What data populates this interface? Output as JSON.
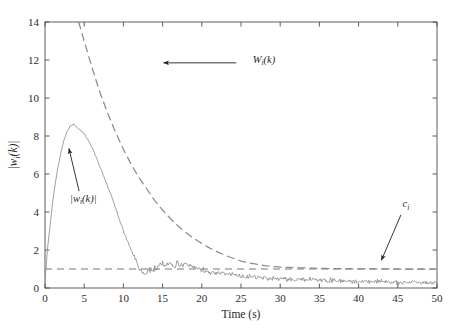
{
  "chart_data": {
    "type": "line",
    "title": "",
    "xlabel": "Time (s)",
    "ylabel": "|w_i(k)|",
    "xlim": [
      0,
      50
    ],
    "ylim": [
      0,
      14
    ],
    "xticks": [
      0,
      5,
      10,
      15,
      20,
      25,
      30,
      35,
      40,
      45,
      50
    ],
    "yticks": [
      0,
      2,
      4,
      6,
      8,
      10,
      12,
      14
    ],
    "grid": false,
    "legend": "none (inline annotations with arrows)",
    "series": [
      {
        "name": "|w_i(k)|",
        "style": "solid",
        "color": "#8c8c8c",
        "description": "noisy signal magnitude: rises steeply from ~0.3 at t=0, peaks ~8.6 near t=3.5, decays to ~0.8 by t=12.5, small noisy bump ~1.3 near t=15-18, then settles to noisy ~0.25-0.5 tail out to t=50",
        "x": [
          0,
          0.3,
          0.6,
          1,
          1.5,
          2,
          2.5,
          3,
          3.3,
          3.6,
          4,
          4.5,
          5,
          5.5,
          6,
          6.5,
          7,
          7.5,
          8,
          8.5,
          9,
          9.5,
          10,
          10.5,
          11,
          11.5,
          12,
          12.5,
          13,
          13.5,
          14,
          14.5,
          15,
          15.5,
          16,
          16.5,
          17,
          17.5,
          18,
          18.5,
          19,
          19.5,
          20,
          21,
          22,
          23,
          24,
          25,
          26,
          27,
          28,
          29,
          30,
          32,
          34,
          36,
          38,
          40,
          42,
          44,
          46,
          48,
          50
        ],
        "y": [
          0.3,
          2.0,
          3.1,
          4.6,
          6.0,
          7.1,
          7.9,
          8.4,
          8.55,
          8.6,
          8.5,
          8.3,
          8.1,
          7.8,
          7.4,
          6.9,
          6.4,
          5.9,
          5.3,
          4.8,
          4.2,
          3.6,
          3.0,
          2.5,
          2.0,
          1.5,
          1.05,
          0.8,
          0.85,
          0.95,
          1.05,
          1.15,
          1.25,
          1.2,
          1.3,
          1.2,
          1.3,
          1.15,
          1.25,
          1.1,
          1.15,
          1.0,
          0.95,
          0.85,
          0.8,
          0.75,
          0.7,
          0.65,
          0.6,
          0.55,
          0.55,
          0.5,
          0.5,
          0.45,
          0.45,
          0.4,
          0.4,
          0.35,
          0.35,
          0.3,
          0.3,
          0.3,
          0.25
        ],
        "noise_amplitude": 0.12
      },
      {
        "name": "W_i(k)",
        "style": "dashed",
        "color": "#8c8c8c",
        "description": "monotonically decreasing envelope/bound, enters top of axes (y=14) at t≈4.3, decays exponentially and asymptotes to c_i = 1 around t≈25",
        "x": [
          4.3,
          5,
          6,
          7,
          8,
          9,
          10,
          11,
          12,
          13,
          14,
          15,
          16,
          17,
          18,
          19,
          20,
          21,
          22,
          23,
          24,
          25,
          26,
          28,
          30,
          35,
          40,
          45,
          50
        ],
        "y": [
          14.0,
          13.0,
          11.6,
          10.3,
          9.2,
          8.2,
          7.3,
          6.5,
          5.8,
          5.2,
          4.6,
          4.1,
          3.65,
          3.25,
          2.9,
          2.6,
          2.35,
          2.1,
          1.9,
          1.72,
          1.56,
          1.42,
          1.32,
          1.18,
          1.1,
          1.03,
          1.01,
          1.0,
          1.0
        ]
      },
      {
        "name": "c_i",
        "style": "dashed-horizontal",
        "color": "#7a7a7a",
        "description": "constant threshold line",
        "value": 1.0,
        "x": [
          0,
          50
        ],
        "y": [
          1.0,
          1.0
        ]
      }
    ],
    "annotations": [
      {
        "id": "annot-W",
        "text_main": "W",
        "text_sub": "i",
        "text_tail": "(k)",
        "label": "W_i(k)",
        "text_x": 26.5,
        "text_y": 11.85,
        "arrow_from_x": 24.4,
        "arrow_from_y": 11.85,
        "arrow_to_x": 15.1,
        "arrow_to_y": 11.85
      },
      {
        "id": "annot-w-abs",
        "text_main": "|w",
        "text_sub": "i",
        "text_tail": "(k)|",
        "label": "|w_i(k)|",
        "text_x": 3.2,
        "text_y": 4.55,
        "arrow_from_x": 4.35,
        "arrow_from_y": 5.1,
        "arrow_to_x": 3.05,
        "arrow_to_y": 7.35
      },
      {
        "id": "annot-c",
        "text_main": "c",
        "text_sub": "i",
        "text_tail": "",
        "label": "c_i",
        "text_x": 45.6,
        "text_y": 4.25,
        "arrow_from_x": 45.4,
        "arrow_from_y": 3.85,
        "arrow_to_x": 42.9,
        "arrow_to_y": 1.45
      }
    ]
  },
  "colors": {
    "axis": "#4d4d4d",
    "signal": "#8c8c8c",
    "envelope": "#8c8c8c",
    "threshold": "#7a7a7a",
    "text": "#1f1f1f",
    "background": "#ffffff"
  }
}
